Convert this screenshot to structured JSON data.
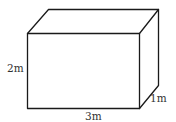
{
  "diagram": {
    "type": "rectangular-prism",
    "labels": {
      "height": "2m",
      "width": "3m",
      "depth": "1m"
    },
    "colors": {
      "stroke": "#1a1a1a",
      "label": "#333333",
      "background": "#ffffff"
    }
  }
}
